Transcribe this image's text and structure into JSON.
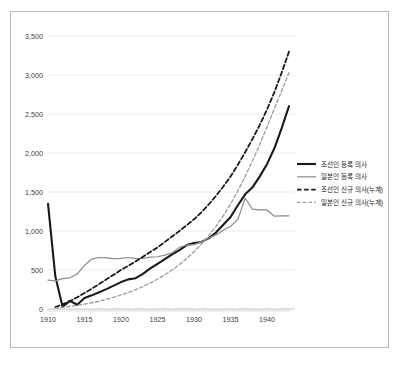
{
  "chart_data": {
    "type": "line",
    "title": "",
    "xlabel": "",
    "ylabel": "",
    "xlim": [
      1910,
      1943
    ],
    "ylim": [
      0,
      3500
    ],
    "grid": true,
    "legend_position": "right",
    "y_ticks": [
      "0",
      "500",
      "1,000",
      "1,500",
      "2,000",
      "2,500",
      "3,000",
      "3,500"
    ],
    "y_tick_values": [
      0,
      500,
      1000,
      1500,
      2000,
      2500,
      3000,
      3500
    ],
    "x_ticks": [
      "1910",
      "1915",
      "1920",
      "1925",
      "1930",
      "1935",
      "1940"
    ],
    "x_tick_values": [
      1910,
      1915,
      1920,
      1925,
      1930,
      1935,
      1940
    ],
    "x": [
      1910,
      1911,
      1912,
      1913,
      1914,
      1915,
      1916,
      1917,
      1918,
      1919,
      1920,
      1921,
      1922,
      1923,
      1924,
      1925,
      1926,
      1927,
      1928,
      1929,
      1930,
      1931,
      1932,
      1933,
      1934,
      1935,
      1936,
      1937,
      1938,
      1939,
      1940,
      1941,
      1942,
      1943
    ],
    "series": [
      {
        "name": "조선인 등록 의사",
        "style": "solid",
        "color": "#1a1a1a",
        "width": 2.1,
        "values": [
          1350,
          420,
          30,
          105,
          55,
          140,
          175,
          215,
          255,
          300,
          345,
          380,
          395,
          450,
          520,
          580,
          640,
          700,
          755,
          820,
          845,
          860,
          905,
          980,
          1080,
          1180,
          1330,
          1470,
          1560,
          1700,
          1860,
          2060,
          2320,
          2600
        ]
      },
      {
        "name": "일본인 등록 의사",
        "style": "solid",
        "color": "#8c8c8c",
        "width": 1.2,
        "values": [
          370,
          360,
          390,
          400,
          450,
          560,
          640,
          660,
          655,
          645,
          650,
          660,
          645,
          650,
          665,
          670,
          690,
          720,
          790,
          820,
          825,
          860,
          910,
          950,
          1010,
          1060,
          1150,
          1420,
          1280,
          1270,
          1270,
          1190,
          1195,
          1195
        ]
      },
      {
        "name": "조선인 신규 의사(누계)",
        "style": "dashed",
        "color": "#1a1a1a",
        "width": 1.8,
        "values": [
          null,
          25,
          60,
          100,
          150,
          205,
          260,
          320,
          380,
          440,
          500,
          555,
          610,
          670,
          730,
          790,
          860,
          930,
          1000,
          1075,
          1150,
          1240,
          1340,
          1450,
          1570,
          1700,
          1850,
          2010,
          2180,
          2360,
          2560,
          2780,
          3030,
          3300
        ]
      },
      {
        "name": "일본인 신규 의사(누계)",
        "style": "dashed",
        "color": "#9b9b9b",
        "width": 1.3,
        "values": [
          null,
          10,
          20,
          32,
          46,
          62,
          80,
          100,
          125,
          150,
          180,
          212,
          248,
          288,
          332,
          382,
          438,
          500,
          570,
          648,
          735,
          832,
          940,
          1060,
          1195,
          1345,
          1515,
          1700,
          1900,
          2110,
          2335,
          2570,
          2800,
          3030
        ]
      }
    ]
  },
  "legend": {
    "items": [
      {
        "label": "조선인 등록 의사"
      },
      {
        "label": "일본인 등록 의사"
      },
      {
        "label": "조선인 신규 의사(누계)"
      },
      {
        "label": "일본인 신규 의사(누계)"
      }
    ]
  }
}
